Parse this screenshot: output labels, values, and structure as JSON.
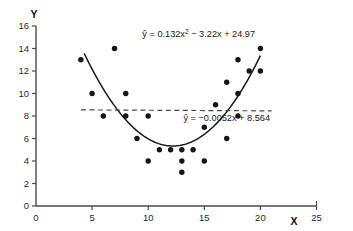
{
  "chart_data": {
    "type": "scatter",
    "title": "",
    "xlabel": "X",
    "ylabel": "Y",
    "xlim": [
      0,
      25
    ],
    "ylim": [
      0,
      16
    ],
    "xticks": [
      0,
      5,
      10,
      15,
      20,
      25
    ],
    "yticks": [
      0,
      2,
      4,
      6,
      8,
      10,
      12,
      14,
      16
    ],
    "grid": false,
    "legend": "none",
    "x": [
      4,
      5,
      6,
      7,
      8,
      8,
      9,
      10,
      10,
      11,
      12,
      13,
      13,
      13,
      14,
      15,
      15,
      16,
      17,
      17,
      18,
      18,
      18,
      19,
      20,
      20
    ],
    "y": [
      13,
      10,
      8,
      14,
      10,
      8,
      6,
      8,
      4,
      5,
      5,
      4,
      3,
      5,
      5,
      7,
      4,
      9,
      6,
      11,
      13,
      10,
      8,
      12,
      14,
      12
    ],
    "points": [
      {
        "x": 4,
        "y": 13
      },
      {
        "x": 5,
        "y": 10
      },
      {
        "x": 6,
        "y": 8
      },
      {
        "x": 7,
        "y": 14
      },
      {
        "x": 8,
        "y": 10
      },
      {
        "x": 8,
        "y": 8
      },
      {
        "x": 9,
        "y": 6
      },
      {
        "x": 10,
        "y": 8
      },
      {
        "x": 10,
        "y": 4
      },
      {
        "x": 11,
        "y": 5
      },
      {
        "x": 12,
        "y": 5
      },
      {
        "x": 13,
        "y": 4
      },
      {
        "x": 13,
        "y": 3
      },
      {
        "x": 13,
        "y": 5
      },
      {
        "x": 14,
        "y": 5
      },
      {
        "x": 15,
        "y": 7
      },
      {
        "x": 15,
        "y": 4
      },
      {
        "x": 16,
        "y": 9
      },
      {
        "x": 17,
        "y": 6
      },
      {
        "x": 17,
        "y": 11
      },
      {
        "x": 18,
        "y": 13
      },
      {
        "x": 18,
        "y": 10
      },
      {
        "x": 18,
        "y": 8
      },
      {
        "x": 19,
        "y": 12
      },
      {
        "x": 20,
        "y": 14
      },
      {
        "x": 20,
        "y": 12
      }
    ],
    "series": [
      {
        "name": "quadratic-fit",
        "kind": "curve",
        "style": "solid",
        "equation_text": "ŷ = 0.132x2 − 3.22x + 24.97",
        "coefficients": {
          "a": 0.132,
          "b": -3.22,
          "c": 24.97
        },
        "x_start": 4.3,
        "x_end": 20.0
      },
      {
        "name": "linear-fit",
        "kind": "line",
        "style": "dashed",
        "equation_text": "ŷ = −0.0052x + 8.564",
        "coefficients": {
          "slope": -0.0052,
          "intercept": 8.564
        },
        "x_start": 4.0,
        "x_end": 21.0
      }
    ],
    "annotations": [
      {
        "name": "quadratic-equation",
        "base": "ŷ = 0.132x",
        "sup": "2",
        "tail": " − 3.22x + 24.97",
        "x": 14.5,
        "y": 15.0
      },
      {
        "name": "linear-equation",
        "text": "ŷ = −0.0052x + 8.564",
        "x": 17.0,
        "y": 7.6
      }
    ]
  },
  "colors": {
    "curve": "#1a1a1a",
    "line": "#4a4a4a",
    "point": "#151515",
    "axis": "#4a4a4a",
    "background": "#ffffff"
  }
}
